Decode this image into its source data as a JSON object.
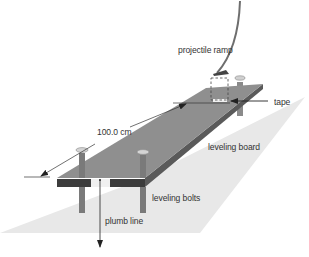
{
  "diagram": {
    "labels": {
      "ramp": "projectile ramp",
      "tape": "tape",
      "distance": "100.0 cm",
      "board": "leveling board",
      "bolts": "leveling bolts",
      "plumb": "plumb line"
    },
    "colors": {
      "ground": "#e6e6e6",
      "board_top": "#8c8c8c",
      "board_side": "#5a5a5a",
      "board_front": "#3c3c3c",
      "bolt": "#7a7a7a",
      "tape": "#f2f2f2",
      "ramp": "#6e6e6e",
      "line": "#333333"
    }
  }
}
